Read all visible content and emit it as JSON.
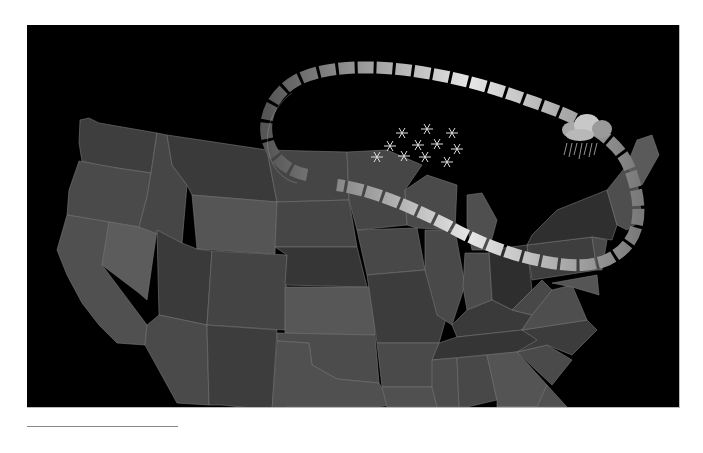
{
  "figure": {
    "type": "map",
    "region": "Contiguous United States",
    "background_color": "#000000",
    "map_style": "grayscale state shading",
    "features": {
      "jet_stream": {
        "shape": "looping arrow path",
        "from": "Great Lakes / upper Midwest",
        "loop": "north over Great Lakes to New England, then south along Atlantic coast, west back to the Ohio Valley"
      },
      "snow_icons": {
        "count": 12,
        "location": "Minnesota / Wisconsin"
      },
      "rain_cloud_icon": {
        "count": 1,
        "location": "New York / northern New England"
      }
    }
  },
  "colors": {
    "state_dark": "#3a3a3a",
    "state_mid": "#4c4c4c",
    "state_light": "#5e5e5e",
    "arrow_light": "#d8d8d8",
    "arrow_dark": "#6a6a6a"
  },
  "footnote_rule": true
}
